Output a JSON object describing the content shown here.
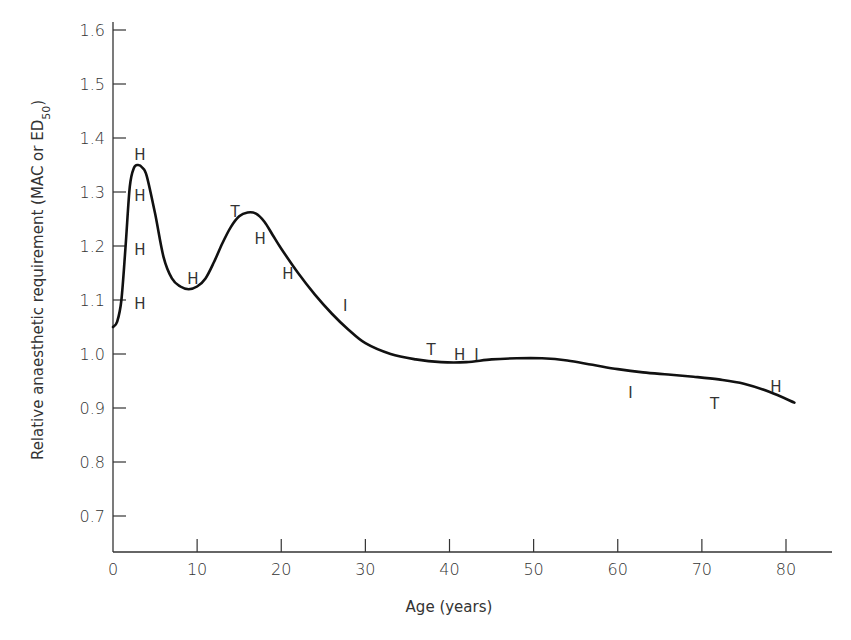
{
  "chart_data": {
    "type": "line",
    "title": "",
    "xlabel": "Age (years)",
    "ylabel": "Relative anaesthetic requirement (MAC or ED50)",
    "ylabel_parts": {
      "main": "Relative anaesthetic requirement (MAC or ED",
      "sub": "50",
      "close": ")"
    },
    "xlim": [
      0,
      85
    ],
    "ylim": [
      0.63,
      1.62
    ],
    "x_ticks": [
      0,
      10,
      20,
      30,
      40,
      50,
      60,
      70,
      80
    ],
    "x_tick_labels": [
      "0",
      "10",
      "20",
      "30",
      "40",
      "50",
      "60",
      "70",
      "80"
    ],
    "y_ticks": [
      0.7,
      0.8,
      0.9,
      1.0,
      1.1,
      1.2,
      1.3,
      1.4,
      1.5,
      1.6
    ],
    "y_tick_labels": [
      "0.7",
      "0.8",
      "0.9",
      "1.0",
      "1.1",
      "1.2",
      "1.3",
      "1.4",
      "1.5",
      "1.6"
    ],
    "grid": false,
    "legend": null,
    "series": [
      {
        "name": "Relative anaesthetic requirement",
        "color": "#111111",
        "x": [
          0,
          0.5,
          1.0,
          1.5,
          2.0,
          2.5,
          3.0,
          3.5,
          4.0,
          5.0,
          6.0,
          7.0,
          8.0,
          9.0,
          10.0,
          11.0,
          12.0,
          13.0,
          14.0,
          15.0,
          16.0,
          17.0,
          18.0,
          19.0,
          20.0,
          22.0,
          24.0,
          26.0,
          28.0,
          30.0,
          33.0,
          36.0,
          39.0,
          42.0,
          45.0,
          48.0,
          51.0,
          54.0,
          57.0,
          60.0,
          63.0,
          66.0,
          69.0,
          72.0,
          75.0,
          78.0,
          81.0
        ],
        "values": [
          1.05,
          1.06,
          1.1,
          1.2,
          1.31,
          1.345,
          1.35,
          1.345,
          1.33,
          1.26,
          1.18,
          1.14,
          1.125,
          1.12,
          1.125,
          1.14,
          1.17,
          1.205,
          1.235,
          1.255,
          1.262,
          1.26,
          1.245,
          1.22,
          1.195,
          1.15,
          1.11,
          1.075,
          1.045,
          1.02,
          1.0,
          0.99,
          0.985,
          0.985,
          0.99,
          0.992,
          0.992,
          0.988,
          0.98,
          0.972,
          0.966,
          0.962,
          0.958,
          0.953,
          0.945,
          0.93,
          0.91
        ]
      }
    ],
    "annotations": [
      {
        "text": "H",
        "x": 3.2,
        "y": 1.37
      },
      {
        "text": "H",
        "x": 3.2,
        "y": 1.295
      },
      {
        "text": "H",
        "x": 3.2,
        "y": 1.195
      },
      {
        "text": "H",
        "x": 3.2,
        "y": 1.095
      },
      {
        "text": "H",
        "x": 9.5,
        "y": 1.14
      },
      {
        "text": "T",
        "x": 14.5,
        "y": 1.265
      },
      {
        "text": "H",
        "x": 17.5,
        "y": 1.215
      },
      {
        "text": "H",
        "x": 20.8,
        "y": 1.15
      },
      {
        "text": "I",
        "x": 27.6,
        "y": 1.09
      },
      {
        "text": "T",
        "x": 37.8,
        "y": 1.01
      },
      {
        "text": "H",
        "x": 41.2,
        "y": 1.0
      },
      {
        "text": "I",
        "x": 43.2,
        "y": 1.0
      },
      {
        "text": "I",
        "x": 61.5,
        "y": 0.93
      },
      {
        "text": "T",
        "x": 71.5,
        "y": 0.91
      },
      {
        "text": "H",
        "x": 78.8,
        "y": 0.94
      }
    ]
  }
}
